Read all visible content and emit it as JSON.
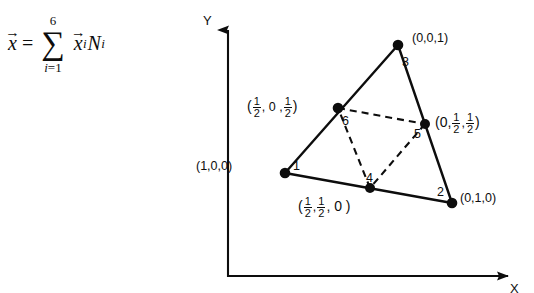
{
  "figure": {
    "equation": {
      "lhs_var": "x",
      "vector_arrow": "→",
      "equals": "=",
      "sigma": "∑",
      "sigma_upper": "6",
      "sigma_lower_index": "i",
      "sigma_lower_equals": "=",
      "sigma_lower_value": "1",
      "term_x": "x",
      "term_x_sub": "i",
      "term_N": "N",
      "term_N_sub": "i"
    },
    "axes": {
      "y_label": "Y",
      "x_label": "X"
    },
    "nodes": [
      {
        "id": "1",
        "number": "1",
        "coord_text": "(1,0,0)",
        "type": "corner"
      },
      {
        "id": "2",
        "number": "2",
        "coord_text": "(0,1,0)",
        "type": "corner"
      },
      {
        "id": "3",
        "number": "3",
        "coord_text": "(0,0,1)",
        "type": "corner"
      },
      {
        "id": "4",
        "number": "4",
        "coord_text": "(1/2,1/2,0)",
        "type": "midside"
      },
      {
        "id": "5",
        "number": "5",
        "coord_text": "(0,1/2,1/2)",
        "type": "midside"
      },
      {
        "id": "6",
        "number": "6",
        "coord_text": "(1/2,0,1/2)",
        "type": "midside"
      }
    ],
    "labels": {
      "node1_coord": "(1,0,0)",
      "node2_coord": "(0,1,0)",
      "node3_coord": "(0,0,1)",
      "node4_paren_open": "(",
      "node4_num1": "1",
      "node4_den1": "2",
      "node4_comma1": ",",
      "node4_num2": "1",
      "node4_den2": "2",
      "node4_tail": ", 0 )",
      "node5_paren_open": "(0,",
      "node5_num1": "1",
      "node5_den1": "2",
      "node5_comma1": ",",
      "node5_num2": "1",
      "node5_den2": "2",
      "node5_tail": ")",
      "node6_paren_open": "(",
      "node6_num1": "1",
      "node6_den1": "2",
      "node6_mid": ", 0 ,",
      "node6_num2": "1",
      "node6_den2": "2",
      "node6_tail": ")",
      "n1": "1",
      "n2": "2",
      "n3": "3",
      "n4": "4",
      "n5": "5",
      "n6": "6"
    },
    "colors": {
      "ink": "#0d0d0d",
      "background": "#ffffff"
    }
  }
}
